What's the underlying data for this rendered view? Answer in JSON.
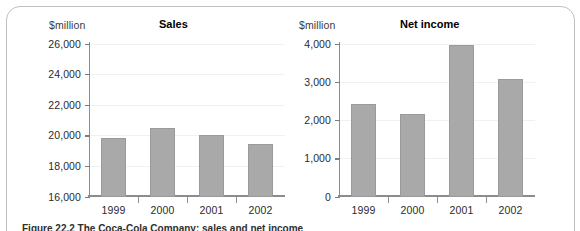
{
  "figure": {
    "caption": "Figure 22.2 The Coca-Cola Company: sales and net income",
    "frame_color": "#bfc1c3",
    "bar_color": "#a9a9a9",
    "axis_color": "#8c8c8c"
  },
  "panels": [
    {
      "id": "sales",
      "unit_label": "$million",
      "title": "Sales"
    },
    {
      "id": "net",
      "unit_label": "$million",
      "title": "Net income"
    }
  ],
  "chart_data": [
    {
      "type": "bar",
      "title": "Sales",
      "xlabel": "",
      "ylabel": "$million",
      "categories": [
        "1999",
        "2000",
        "2001",
        "2002"
      ],
      "values": [
        19800,
        20500,
        20050,
        19400
      ],
      "ylim": [
        16000,
        26000
      ],
      "yticks": [
        16000,
        18000,
        20000,
        22000,
        24000,
        26000
      ],
      "ytick_labels": [
        "16,000",
        "18,000",
        "20,000",
        "22,000",
        "24,000",
        "26,000"
      ],
      "grid": true,
      "legend": "none",
      "bar_color": "#a9a9a9"
    },
    {
      "type": "bar",
      "title": "Net income",
      "xlabel": "",
      "ylabel": "$million",
      "categories": [
        "1999",
        "2000",
        "2001",
        "2002"
      ],
      "values": [
        2420,
        2150,
        3950,
        3070
      ],
      "ylim": [
        0,
        4000
      ],
      "yticks": [
        0,
        1000,
        2000,
        3000,
        4000
      ],
      "ytick_labels": [
        "0",
        "1,000",
        "2,000",
        "3,000",
        "4,000"
      ],
      "grid": true,
      "legend": "none",
      "bar_color": "#a9a9a9"
    }
  ]
}
